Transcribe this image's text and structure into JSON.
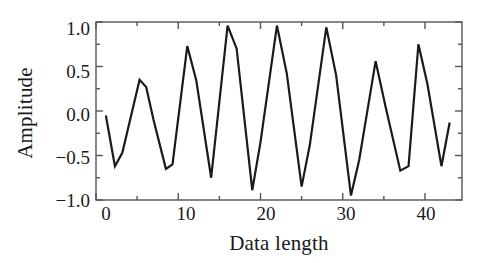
{
  "chart_data": {
    "type": "line",
    "title": "",
    "xlabel": "Data length",
    "ylabel": "Amplitude",
    "xlim": [
      0,
      44.5
    ],
    "ylim": [
      -1.0,
      1.0
    ],
    "grid": false,
    "legend": null,
    "line_color": "#1a1a1a",
    "line_width": 2.2,
    "background_color": "#ffffff",
    "axis_color": "#555555",
    "xticks": [
      0,
      10,
      20,
      30,
      40
    ],
    "xtick_labels": [
      "0",
      "10",
      "20",
      "30",
      "40"
    ],
    "xminor_ticks": [
      5,
      15,
      25,
      35
    ],
    "yticks": [
      -1.0,
      -0.5,
      0.0,
      0.5,
      1.0
    ],
    "ytick_labels": [
      "−1.0",
      "−0.5",
      "0.0",
      "0.5",
      "1.0"
    ],
    "yminor_ticks": [
      -0.75,
      -0.25,
      0.25,
      0.75
    ],
    "x": [
      1.2,
      2.3,
      3.2,
      5.3,
      6.1,
      7.0,
      8.5,
      9.3,
      11.1,
      12.2,
      14.0,
      16.0,
      17.1,
      19.0,
      20.0,
      22.0,
      23.2,
      25.0,
      26.0,
      28.0,
      29.2,
      31.0,
      32.0,
      34.0,
      35.2,
      37.0,
      38.0,
      39.2,
      40.3,
      42.0,
      43.0
    ],
    "y": [
      -0.05,
      -0.62,
      -0.47,
      0.35,
      0.27,
      -0.1,
      -0.65,
      -0.6,
      0.73,
      0.34,
      -0.75,
      0.96,
      0.7,
      -0.89,
      -0.35,
      0.96,
      0.42,
      -0.85,
      -0.38,
      0.94,
      0.4,
      -0.95,
      -0.55,
      0.56,
      0.05,
      -0.67,
      -0.62,
      0.75,
      0.3,
      -0.62,
      -0.13
    ],
    "series": [
      {
        "name": "signal",
        "values": [
          -0.05,
          -0.62,
          -0.47,
          0.35,
          0.27,
          -0.1,
          -0.65,
          -0.6,
          0.73,
          0.34,
          -0.75,
          0.96,
          0.7,
          -0.89,
          -0.35,
          0.96,
          0.42,
          -0.85,
          -0.38,
          0.94,
          0.4,
          -0.95,
          -0.55,
          0.56,
          0.05,
          -0.67,
          -0.62,
          0.75,
          0.3,
          -0.62,
          -0.13
        ]
      }
    ]
  }
}
